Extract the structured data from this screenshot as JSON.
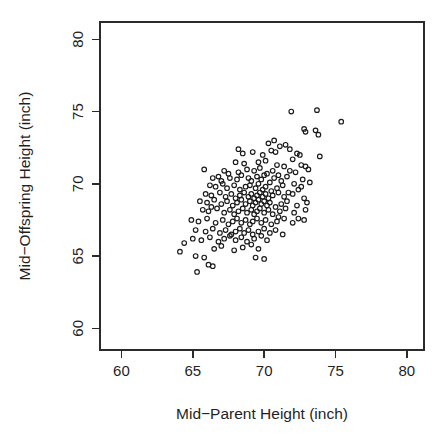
{
  "chart_data": {
    "type": "scatter",
    "title": "",
    "xlabel": "Mid−Parent Height (inch)",
    "ylabel": "Mid−Offspring Height (inch)",
    "xlim": [
      58.5,
      81.2
    ],
    "ylim": [
      58.5,
      81.2
    ],
    "xticks": [
      60,
      65,
      70,
      75,
      80
    ],
    "yticks": [
      60,
      65,
      70,
      75,
      80
    ],
    "xtick_labels": [
      "60",
      "65",
      "70",
      "75",
      "80"
    ],
    "ytick_labels": [
      "60",
      "65",
      "70",
      "75",
      "80"
    ],
    "grid": false,
    "legend": "none",
    "marker": "open-circle",
    "marker_size_px": 4.6,
    "marker_color": "#1a1a1a",
    "n_points": 205,
    "points": [
      [
        71.9,
        75.0
      ],
      [
        73.7,
        75.1
      ],
      [
        75.4,
        74.3
      ],
      [
        72.8,
        73.8
      ],
      [
        72.9,
        73.6
      ],
      [
        73.6,
        73.7
      ],
      [
        73.8,
        73.4
      ],
      [
        70.3,
        72.8
      ],
      [
        71.1,
        72.6
      ],
      [
        71.5,
        72.7
      ],
      [
        70.5,
        72.3
      ],
      [
        69.2,
        72.2
      ],
      [
        68.5,
        72.1
      ],
      [
        69.9,
        72.0
      ],
      [
        70.8,
        72.2
      ],
      [
        72.3,
        72.1
      ],
      [
        72.5,
        72.0
      ],
      [
        73.9,
        71.9
      ],
      [
        72.0,
        71.7
      ],
      [
        68.0,
        71.5
      ],
      [
        68.6,
        71.4
      ],
      [
        69.6,
        71.5
      ],
      [
        70.1,
        71.6
      ],
      [
        70.9,
        71.3
      ],
      [
        71.4,
        71.2
      ],
      [
        72.6,
        71.3
      ],
      [
        72.9,
        71.2
      ],
      [
        65.8,
        71.0
      ],
      [
        67.2,
        70.9
      ],
      [
        68.2,
        70.8
      ],
      [
        68.8,
        71.0
      ],
      [
        69.3,
        70.9
      ],
      [
        69.7,
        71.1
      ],
      [
        70.2,
        70.7
      ],
      [
        70.6,
        70.9
      ],
      [
        71.0,
        70.6
      ],
      [
        71.8,
        70.9
      ],
      [
        72.2,
        70.8
      ],
      [
        66.4,
        70.4
      ],
      [
        66.8,
        70.5
      ],
      [
        67.0,
        70.2
      ],
      [
        67.6,
        70.4
      ],
      [
        68.1,
        70.3
      ],
      [
        68.4,
        70.6
      ],
      [
        68.9,
        70.4
      ],
      [
        69.1,
        70.2
      ],
      [
        69.5,
        70.5
      ],
      [
        69.8,
        70.3
      ],
      [
        70.0,
        70.6
      ],
      [
        70.4,
        70.1
      ],
      [
        70.7,
        70.4
      ],
      [
        71.2,
        70.2
      ],
      [
        71.6,
        70.5
      ],
      [
        72.1,
        70.0
      ],
      [
        72.7,
        70.3
      ],
      [
        73.2,
        70.1
      ],
      [
        66.2,
        69.9
      ],
      [
        66.6,
        69.8
      ],
      [
        67.1,
        70.0
      ],
      [
        67.4,
        69.7
      ],
      [
        67.9,
        69.9
      ],
      [
        68.3,
        69.6
      ],
      [
        68.7,
        69.8
      ],
      [
        69.0,
        69.9
      ],
      [
        69.4,
        69.7
      ],
      [
        69.6,
        70.0
      ],
      [
        69.9,
        69.6
      ],
      [
        70.1,
        69.8
      ],
      [
        70.5,
        69.5
      ],
      [
        70.9,
        69.7
      ],
      [
        71.3,
        69.9
      ],
      [
        71.7,
        69.4
      ],
      [
        72.4,
        69.6
      ],
      [
        65.9,
        69.3
      ],
      [
        66.3,
        69.2
      ],
      [
        66.9,
        69.4
      ],
      [
        67.3,
        69.1
      ],
      [
        67.7,
        69.3
      ],
      [
        68.0,
        69.0
      ],
      [
        68.3,
        69.2
      ],
      [
        68.6,
        69.4
      ],
      [
        68.9,
        69.1
      ],
      [
        69.1,
        69.3
      ],
      [
        69.3,
        69.0
      ],
      [
        69.5,
        69.2
      ],
      [
        69.7,
        69.4
      ],
      [
        69.9,
        69.1
      ],
      [
        70.1,
        69.3
      ],
      [
        70.3,
        69.0
      ],
      [
        70.6,
        69.2
      ],
      [
        71.0,
        69.4
      ],
      [
        71.4,
        69.1
      ],
      [
        72.0,
        69.3
      ],
      [
        72.8,
        69.0
      ],
      [
        65.5,
        68.8
      ],
      [
        66.0,
        68.7
      ],
      [
        66.5,
        68.9
      ],
      [
        67.0,
        68.6
      ],
      [
        67.4,
        68.8
      ],
      [
        67.8,
        68.5
      ],
      [
        68.1,
        68.7
      ],
      [
        68.4,
        68.9
      ],
      [
        68.7,
        68.6
      ],
      [
        69.0,
        68.8
      ],
      [
        69.2,
        68.5
      ],
      [
        69.4,
        68.7
      ],
      [
        69.6,
        68.9
      ],
      [
        69.8,
        68.6
      ],
      [
        70.0,
        68.8
      ],
      [
        70.2,
        68.5
      ],
      [
        70.4,
        68.7
      ],
      [
        70.8,
        68.4
      ],
      [
        71.2,
        68.6
      ],
      [
        71.6,
        68.8
      ],
      [
        72.3,
        68.5
      ],
      [
        73.0,
        68.7
      ],
      [
        65.7,
        68.2
      ],
      [
        66.1,
        68.1
      ],
      [
        66.7,
        68.3
      ],
      [
        67.2,
        68.0
      ],
      [
        67.6,
        68.2
      ],
      [
        67.9,
        67.9
      ],
      [
        68.2,
        68.1
      ],
      [
        68.5,
        68.3
      ],
      [
        68.8,
        68.0
      ],
      [
        69.1,
        68.2
      ],
      [
        69.3,
        67.9
      ],
      [
        69.5,
        68.1
      ],
      [
        69.7,
        68.3
      ],
      [
        70.0,
        68.0
      ],
      [
        70.3,
        68.2
      ],
      [
        70.6,
        67.9
      ],
      [
        71.1,
        68.1
      ],
      [
        71.5,
        68.3
      ],
      [
        72.1,
        68.0
      ],
      [
        72.9,
        68.2
      ],
      [
        64.9,
        67.5
      ],
      [
        65.4,
        67.4
      ],
      [
        66.0,
        67.6
      ],
      [
        66.6,
        67.3
      ],
      [
        67.1,
        67.5
      ],
      [
        67.5,
        67.2
      ],
      [
        67.8,
        67.4
      ],
      [
        68.1,
        67.6
      ],
      [
        68.4,
        67.3
      ],
      [
        68.7,
        67.5
      ],
      [
        69.0,
        67.2
      ],
      [
        69.2,
        67.4
      ],
      [
        69.5,
        67.6
      ],
      [
        69.8,
        67.3
      ],
      [
        70.1,
        67.5
      ],
      [
        70.5,
        67.2
      ],
      [
        70.9,
        67.4
      ],
      [
        71.4,
        67.6
      ],
      [
        72.0,
        67.3
      ],
      [
        72.8,
        67.5
      ],
      [
        65.2,
        66.8
      ],
      [
        65.9,
        66.7
      ],
      [
        66.4,
        66.9
      ],
      [
        66.9,
        66.6
      ],
      [
        67.3,
        66.8
      ],
      [
        67.7,
        66.5
      ],
      [
        68.0,
        66.7
      ],
      [
        68.3,
        66.9
      ],
      [
        68.6,
        66.6
      ],
      [
        68.9,
        66.8
      ],
      [
        69.2,
        66.5
      ],
      [
        69.6,
        66.7
      ],
      [
        70.0,
        66.9
      ],
      [
        70.4,
        66.6
      ],
      [
        70.8,
        66.8
      ],
      [
        71.3,
        66.5
      ],
      [
        65.0,
        66.2
      ],
      [
        65.6,
        66.1
      ],
      [
        66.2,
        66.3
      ],
      [
        66.8,
        66.0
      ],
      [
        67.2,
        66.2
      ],
      [
        67.6,
        66.4
      ],
      [
        68.0,
        66.1
      ],
      [
        68.4,
        66.3
      ],
      [
        68.8,
        66.0
      ],
      [
        69.3,
        66.2
      ],
      [
        69.8,
        66.4
      ],
      [
        70.2,
        66.1
      ],
      [
        64.4,
        65.9
      ],
      [
        66.5,
        65.5
      ],
      [
        67.0,
        65.7
      ],
      [
        67.9,
        65.4
      ],
      [
        68.5,
        65.6
      ],
      [
        69.1,
        65.8
      ],
      [
        69.6,
        65.5
      ],
      [
        64.1,
        65.3
      ],
      [
        65.2,
        65.0
      ],
      [
        65.8,
        64.9
      ],
      [
        66.1,
        64.4
      ],
      [
        66.4,
        64.3
      ],
      [
        65.3,
        63.9
      ],
      [
        70.0,
        64.8
      ],
      [
        73.1,
        71.0
      ],
      [
        72.6,
        69.8
      ],
      [
        71.8,
        72.4
      ],
      [
        70.7,
        73.0
      ],
      [
        67.5,
        70.7
      ],
      [
        66.3,
        68.4
      ],
      [
        68.2,
        72.4
      ],
      [
        71.0,
        67.7
      ],
      [
        72.4,
        67.6
      ],
      [
        69.4,
        64.9
      ]
    ]
  },
  "figure": {
    "plot_box": {
      "left": 100,
      "top": 22,
      "right": 424,
      "bottom": 350
    },
    "background_color": "#ffffff",
    "frame_color": "#2b2b2b"
  }
}
